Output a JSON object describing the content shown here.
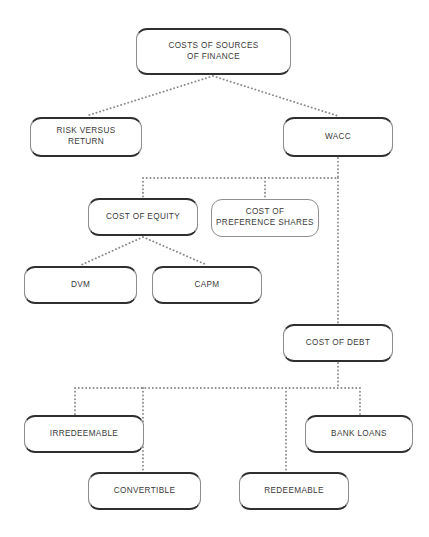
{
  "diagram": {
    "style": {
      "background": "#ffffff",
      "box_fill": "#ffffff",
      "box_border": "#9a9a9a",
      "box_edge_dark": "#2f2f2f",
      "text_color": "#3a3a3a",
      "connector_color": "#8a8a8a",
      "connector_style": "dotted"
    },
    "nodes": [
      {
        "id": "root",
        "label": "COSTS OF SOURCES\nOF FINANCE",
        "x": 136,
        "y": 28,
        "w": 155,
        "h": 47,
        "edge": "lip"
      },
      {
        "id": "risk",
        "label": "RISK VERSUS\nRETURN",
        "x": 30,
        "y": 117,
        "w": 112,
        "h": 40,
        "edge": "lip"
      },
      {
        "id": "wacc",
        "label": "WACC",
        "x": 283,
        "y": 117,
        "w": 110,
        "h": 40,
        "edge": "lip"
      },
      {
        "id": "equity",
        "label": "COST OF EQUITY",
        "x": 88,
        "y": 198,
        "w": 110,
        "h": 38,
        "edge": "lip"
      },
      {
        "id": "preference",
        "label": "COST OF\nPREFERENCE SHARES",
        "x": 211,
        "y": 199,
        "w": 108,
        "h": 38,
        "edge": "plain"
      },
      {
        "id": "dvm",
        "label": "DVM",
        "x": 24,
        "y": 266,
        "w": 113,
        "h": 38,
        "edge": "lip"
      },
      {
        "id": "capm",
        "label": "CAPM",
        "x": 152,
        "y": 266,
        "w": 110,
        "h": 38,
        "edge": "lip"
      },
      {
        "id": "debt",
        "label": "COST OF DEBT",
        "x": 283,
        "y": 324,
        "w": 110,
        "h": 38,
        "edge": "lip"
      },
      {
        "id": "irredeemable",
        "label": "IRREDEEMABLE",
        "x": 24,
        "y": 415,
        "w": 120,
        "h": 38,
        "edge": "lip"
      },
      {
        "id": "bankloans",
        "label": "BANK LOANS",
        "x": 305,
        "y": 415,
        "w": 108,
        "h": 38,
        "edge": "lip"
      },
      {
        "id": "convertible",
        "label": "CONVERTIBLE",
        "x": 88,
        "y": 472,
        "w": 113,
        "h": 38,
        "edge": "lip"
      },
      {
        "id": "redeemable",
        "label": "REDEEMABLE",
        "x": 239,
        "y": 472,
        "w": 110,
        "h": 38,
        "edge": "lip"
      }
    ],
    "connections": [
      {
        "from": "root",
        "to": "risk",
        "kind": "diagonal"
      },
      {
        "from": "root",
        "to": "wacc",
        "kind": "diagonal"
      },
      {
        "from": "wacc",
        "to": "equity",
        "kind": "orthogonal"
      },
      {
        "from": "wacc",
        "to": "preference",
        "kind": "orthogonal"
      },
      {
        "from": "wacc",
        "to": "debt",
        "kind": "straight"
      },
      {
        "from": "equity",
        "to": "dvm",
        "kind": "diagonal"
      },
      {
        "from": "equity",
        "to": "capm",
        "kind": "diagonal"
      },
      {
        "from": "debt",
        "to": "irredeemable",
        "kind": "orthogonal"
      },
      {
        "from": "debt",
        "to": "convertible",
        "kind": "orthogonal"
      },
      {
        "from": "debt",
        "to": "redeemable",
        "kind": "orthogonal"
      },
      {
        "from": "debt",
        "to": "bankloans",
        "kind": "orthogonal"
      }
    ],
    "wire_paths": [
      {
        "name": "root-fan",
        "d": "M 213 76 L 86 116 M 213 76 L 338 116"
      },
      {
        "name": "wacc-bus",
        "d": "M 338 158 L 338 178 M 143 178 L 338 178 M 143 178 L 143 197 M 265 178 L 265 198"
      },
      {
        "name": "wacc-debt",
        "d": "M 338 178 L 338 323"
      },
      {
        "name": "equity-fan",
        "d": "M 143 237 L 81 265 M 143 237 L 207 265"
      },
      {
        "name": "debt-bus",
        "d": "M 338 363 L 338 388 M 75 388 L 360 388 M 75 388 L 75 414 M 143 388 L 143 471 M 286 388 L 286 471 M 360 388 L 360 414"
      }
    ]
  }
}
